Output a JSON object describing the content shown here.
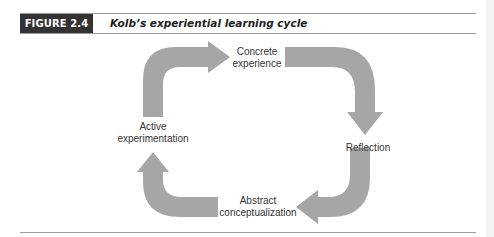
{
  "figure": {
    "label": "FIGURE 2.4",
    "title": "Kolb’s experiential learning cycle"
  },
  "diagram": {
    "type": "cycle",
    "arrow_color": "#a6a6a6",
    "header_color": "#333333",
    "nodes": [
      {
        "id": "concrete",
        "line1": "Concrete",
        "line2": "experience"
      },
      {
        "id": "reflection",
        "line1": "Reflection",
        "line2": ""
      },
      {
        "id": "abstract",
        "line1": "Abstract",
        "line2": "conceptualization"
      },
      {
        "id": "active",
        "line1": "Active",
        "line2": "experimentation"
      }
    ],
    "edges": [
      {
        "from": "active",
        "to": "concrete",
        "direction": "clockwise"
      },
      {
        "from": "concrete",
        "to": "reflection",
        "direction": "clockwise"
      },
      {
        "from": "reflection",
        "to": "abstract",
        "direction": "clockwise"
      },
      {
        "from": "abstract",
        "to": "active",
        "direction": "clockwise"
      }
    ]
  }
}
